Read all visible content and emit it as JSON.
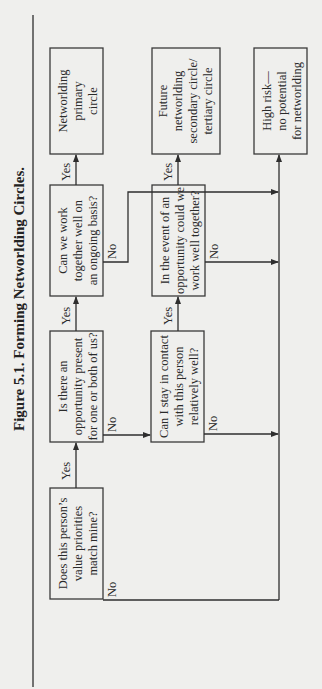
{
  "figure": {
    "title": "Figure 5.1.  Forming Networlding Circles.",
    "orientation": "rotated 90° counterclockwise"
  },
  "nodes": {
    "q1": {
      "lines": [
        "Does this person’s",
        "value priorities",
        "match mine?"
      ]
    },
    "q2": {
      "lines": [
        "Is there an",
        "opportunity present",
        "for one or both of us?"
      ]
    },
    "q3": {
      "lines": [
        "Can we work",
        "together well on",
        "an ongoing basis?"
      ]
    },
    "q4": {
      "lines": [
        "Can I stay in contact",
        "with this person",
        "relatively well?"
      ]
    },
    "q5": {
      "lines": [
        "In the event of an",
        "opportunity could we",
        "work well together?"
      ]
    },
    "primary": {
      "lines": [
        "Networlding",
        "primary",
        "circle"
      ]
    },
    "future": {
      "lines": [
        "Future",
        "networlding",
        "secondary circle/",
        "tertiary circle"
      ]
    },
    "highrisk": {
      "lines": [
        "High risk—",
        "no potential",
        "for networlding"
      ]
    }
  },
  "edges": {
    "yes": "Yes",
    "no": "No"
  },
  "edge_list": [
    {
      "from": "q1",
      "to": "q2",
      "label": "Yes"
    },
    {
      "from": "q1",
      "to": "highrisk",
      "label": "No"
    },
    {
      "from": "q2",
      "to": "q3",
      "label": "Yes"
    },
    {
      "from": "q2",
      "to": "q4",
      "label": "No"
    },
    {
      "from": "q3",
      "to": "primary",
      "label": "Yes"
    },
    {
      "from": "q3",
      "to": "highrisk",
      "label": "No"
    },
    {
      "from": "q4",
      "to": "q5",
      "label": "Yes"
    },
    {
      "from": "q4",
      "to": "highrisk",
      "label": "No"
    },
    {
      "from": "q5",
      "to": "future",
      "label": "Yes"
    },
    {
      "from": "q5",
      "to": "highrisk",
      "label": "No"
    }
  ]
}
